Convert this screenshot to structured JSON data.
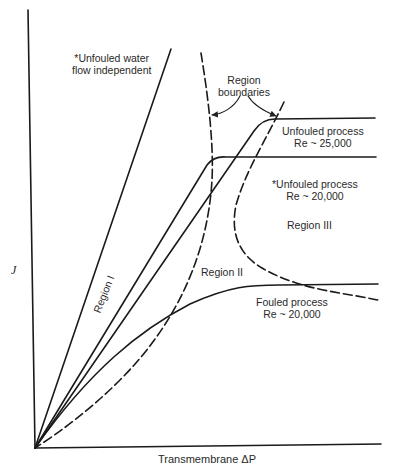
{
  "diagram": {
    "type": "flux-vs-pressure",
    "axes": {
      "y_label": "J",
      "x_label": "Transmembrane ΔP"
    },
    "curves": [
      {
        "id": "water",
        "style": "solid",
        "label_line1": "*Unfouled water",
        "label_line2": "flow independent"
      },
      {
        "id": "unfouled-25000",
        "style": "solid",
        "label_line1": "Unfouled process",
        "label_line2": "Re ~ 25,000"
      },
      {
        "id": "unfouled-20000",
        "style": "solid",
        "label_line1": "*Unfouled process",
        "label_line2": "Re ~ 20,000"
      },
      {
        "id": "fouled-20000",
        "style": "solid",
        "label_line1": "Fouled process",
        "label_line2": "Re ~ 20,000"
      },
      {
        "id": "boundary-1",
        "style": "dashed"
      },
      {
        "id": "boundary-2",
        "style": "dashed"
      }
    ],
    "annotations": {
      "boundaries_line1": "Region",
      "boundaries_line2": "boundaries"
    },
    "regions": [
      {
        "id": "I",
        "label": "Region I"
      },
      {
        "id": "II",
        "label": "Region II"
      },
      {
        "id": "III",
        "label": "Region III"
      }
    ],
    "line_color": "#1a1a1a"
  }
}
